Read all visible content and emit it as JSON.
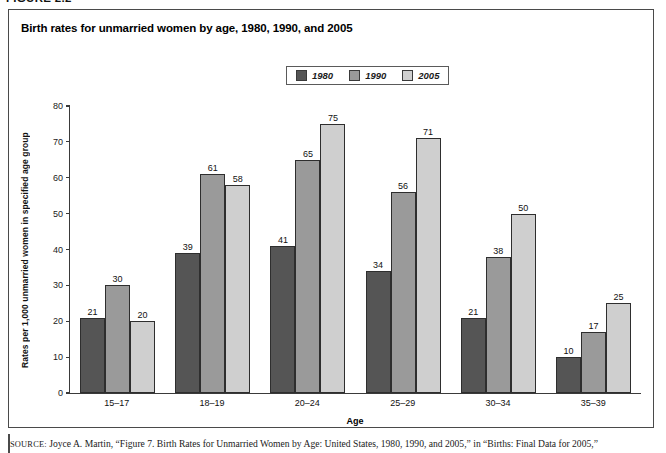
{
  "figure": {
    "label": "FIGURE 2.2",
    "title": "Birth rates for unmarried women by age, 1980, 1990, and 2005"
  },
  "legend": {
    "position": "top-center",
    "entries": [
      {
        "label": "1980",
        "color": "#555555"
      },
      {
        "label": "1990",
        "color": "#9a9a9a"
      },
      {
        "label": "2005",
        "color": "#cfcfcf"
      }
    ]
  },
  "source": {
    "kicker": "SOURCE:",
    "text": "Joyce A. Martin, “Figure 7. Birth Rates for Unmarried Women by Age: United States, 1980, 1990, and 2005,” in “Births: Final Data for 2005,”"
  },
  "chart_data": {
    "type": "bar",
    "title": "Birth rates for unmarried women by age, 1980, 1990, and 2005",
    "xlabel": "Age",
    "ylabel": "Rates per 1,000 unmarried women in specified age group",
    "categories": [
      "15–17",
      "18–19",
      "20–24",
      "25–29",
      "30–34",
      "35–39"
    ],
    "series": [
      {
        "name": "1980",
        "color": "#555555",
        "values": [
          21,
          39,
          41,
          34,
          21,
          10
        ]
      },
      {
        "name": "1990",
        "color": "#9a9a9a",
        "values": [
          30,
          61,
          65,
          56,
          38,
          17
        ]
      },
      {
        "name": "2005",
        "color": "#cfcfcf",
        "values": [
          20,
          58,
          75,
          71,
          50,
          25
        ]
      }
    ],
    "ylim": [
      0,
      80
    ],
    "yticks": [
      0,
      10,
      20,
      30,
      40,
      50,
      60,
      70,
      80
    ],
    "ytick_labels": [
      "0",
      "10",
      "20",
      "30",
      "40",
      "50",
      "60",
      "70",
      "80"
    ],
    "grid": false,
    "data_labels": true,
    "legend_position": "top-center"
  }
}
